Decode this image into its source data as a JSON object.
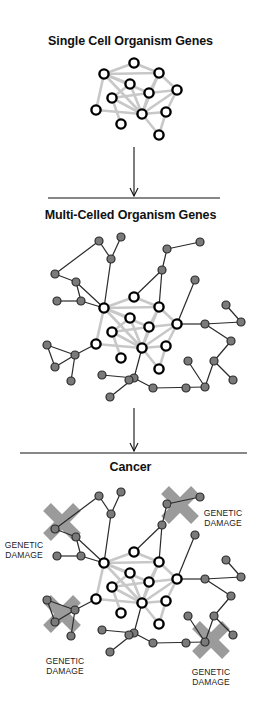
{
  "panels": [
    {
      "title": "Single Cell Organism Genes"
    },
    {
      "title": "Multi-Celled Organism Genes"
    },
    {
      "title": "Cancer"
    }
  ],
  "damage_labels": [
    {
      "line1": "GENETIC",
      "line2": "DAMAGE",
      "position": "upper-left"
    },
    {
      "line1": "GENETIC",
      "line2": "DAMAGE",
      "position": "upper-right"
    },
    {
      "line1": "GENETIC",
      "line2": "DAMAGE",
      "position": "lower-left"
    },
    {
      "line1": "GENETIC",
      "line2": "DAMAGE",
      "position": "lower-right"
    }
  ],
  "colors": {
    "core_node_stroke": "#000000",
    "core_node_fill": "#ffffff",
    "core_edge": "#c8c8c8",
    "peripheral_node_fill": "#7a7a7a",
    "peripheral_edge": "#2a2a2a",
    "damage_x": "#8a8a8a",
    "arrow": "#111111"
  },
  "network": {
    "core_nodes": [
      [
        134,
        63
      ],
      [
        104,
        74
      ],
      [
        159,
        73
      ],
      [
        130,
        84
      ],
      [
        149,
        93
      ],
      [
        177,
        90
      ],
      [
        112,
        98
      ],
      [
        96,
        110
      ],
      [
        142,
        114
      ],
      [
        166,
        112
      ],
      [
        121,
        124
      ],
      [
        159,
        135
      ]
    ],
    "core_edges": [
      [
        0,
        1
      ],
      [
        0,
        2
      ],
      [
        1,
        2
      ],
      [
        1,
        3
      ],
      [
        1,
        7
      ],
      [
        1,
        4
      ],
      [
        1,
        8
      ],
      [
        2,
        4
      ],
      [
        2,
        5
      ],
      [
        2,
        8
      ],
      [
        3,
        6
      ],
      [
        3,
        8
      ],
      [
        4,
        8
      ],
      [
        4,
        5
      ],
      [
        5,
        9
      ],
      [
        6,
        8
      ],
      [
        6,
        10
      ],
      [
        7,
        8
      ],
      [
        8,
        9
      ],
      [
        8,
        11
      ],
      [
        9,
        11
      ],
      [
        4,
        6
      ],
      [
        5,
        8
      ]
    ],
    "multi_offset": [
      0,
      234
    ],
    "cancer_offset": [
      0,
      489
    ],
    "peripheral_nodes": [
      [
        99,
        241
      ],
      [
        121,
        237
      ],
      [
        111,
        259
      ],
      [
        55,
        274
      ],
      [
        76,
        282
      ],
      [
        57,
        301
      ],
      [
        81,
        301
      ],
      [
        167,
        249
      ],
      [
        200,
        242
      ],
      [
        162,
        270
      ],
      [
        195,
        280
      ],
      [
        226,
        305
      ],
      [
        241,
        322
      ],
      [
        205,
        324
      ],
      [
        231,
        341
      ],
      [
        214,
        361
      ],
      [
        188,
        361
      ],
      [
        233,
        380
      ],
      [
        205,
        387
      ],
      [
        186,
        388
      ],
      [
        153,
        388
      ],
      [
        134,
        378
      ],
      [
        102,
        375
      ],
      [
        110,
        397
      ],
      [
        129,
        380
      ],
      [
        47,
        345
      ],
      [
        75,
        355
      ],
      [
        55,
        367
      ],
      [
        71,
        381
      ]
    ],
    "peripheral_edges": [
      [
        "p2",
        "c1"
      ],
      [
        "p0",
        "p2"
      ],
      [
        "p0",
        "p3"
      ],
      [
        "p1",
        "p2"
      ],
      [
        "p3",
        "p4"
      ],
      [
        "p4",
        "c1"
      ],
      [
        "p4",
        "p6"
      ],
      [
        "p5",
        "p6"
      ],
      [
        "p6",
        "c1"
      ],
      [
        "p9",
        "c0"
      ],
      [
        "p7",
        "p9"
      ],
      [
        "p7",
        "p8"
      ],
      [
        "p9",
        "c2"
      ],
      [
        "p10",
        "c5"
      ],
      [
        "c5",
        "p13"
      ],
      [
        "p13",
        "p14"
      ],
      [
        "p13",
        "p12"
      ],
      [
        "p11",
        "p12"
      ],
      [
        "p14",
        "p15"
      ],
      [
        "p15",
        "p17"
      ],
      [
        "p15",
        "p18"
      ],
      [
        "p16",
        "p18"
      ],
      [
        "p18",
        "p20"
      ],
      [
        "p20",
        "p21"
      ],
      [
        "p21",
        "p22"
      ],
      [
        "p21",
        "p23"
      ],
      [
        "p21",
        "c8"
      ],
      [
        "c7",
        "p26"
      ],
      [
        "p25",
        "p26"
      ],
      [
        "p25",
        "p27"
      ],
      [
        "p26",
        "p27"
      ],
      [
        "p26",
        "p28"
      ]
    ]
  },
  "damage_marks": [
    {
      "cx": 62,
      "cy": 522,
      "size": 30
    },
    {
      "cx": 180,
      "cy": 505,
      "size": 30
    },
    {
      "cx": 62,
      "cy": 614,
      "size": 30
    },
    {
      "cx": 211,
      "cy": 640,
      "size": 30
    }
  ]
}
